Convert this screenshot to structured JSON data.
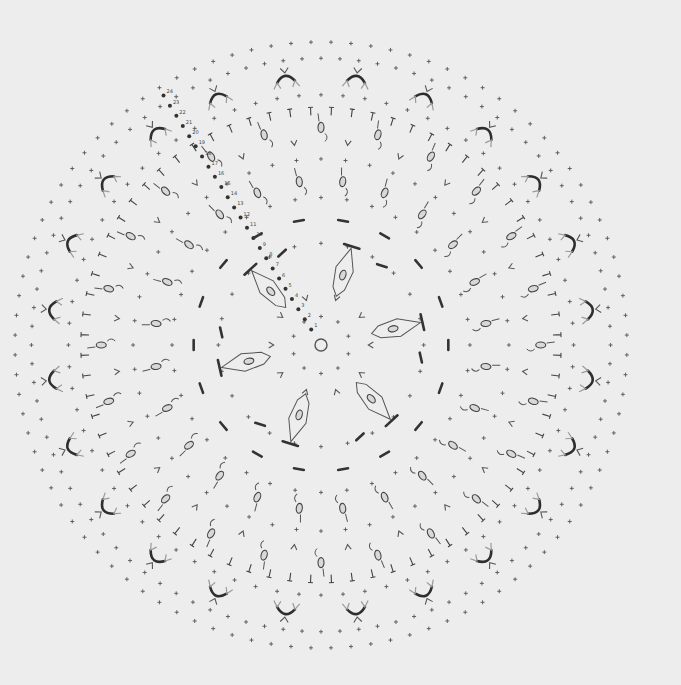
{
  "diagram": {
    "type": "crochet-doily-chart",
    "background": "#ededed",
    "ink": "#333333",
    "light_ink": "#9a9a9a",
    "center": {
      "x": 321,
      "y": 345
    },
    "outer_radius_x": 306,
    "outer_radius_y": 303,
    "center_ring": {
      "symbol": "magic-ring",
      "radius": 6
    },
    "inner_motif": {
      "petals": 6,
      "radius": 72,
      "symbol": "kite-cluster"
    },
    "round_labels": [
      "1",
      "2",
      "3",
      "4",
      "5",
      "6",
      "7",
      "8",
      "9",
      "10",
      "11",
      "12",
      "13",
      "14",
      "15",
      "16",
      "17",
      "18",
      "19",
      "20",
      "21",
      "22",
      "23",
      "24"
    ],
    "round_label_angle_deg": -122,
    "rings": [
      {
        "r": 28,
        "symbol": "sc-plus",
        "count": 10
      },
      {
        "r": 48,
        "symbol": "chain-v",
        "count": 10
      },
      {
        "r": 100,
        "symbol": "sc-plus",
        "count": 24
      },
      {
        "r": 124,
        "symbol": "bar-cluster",
        "count": 18
      },
      {
        "r": 145,
        "symbol": "sc-plus",
        "count": 36
      },
      {
        "r": 162,
        "symbol": "oval-picot-spoke",
        "count": 24
      },
      {
        "r": 183,
        "symbol": "sc-plus",
        "count": 48
      },
      {
        "r": 200,
        "symbol": "chain-v",
        "count": 24
      },
      {
        "r": 214,
        "symbol": "oval-picot-spoke",
        "count": 24
      },
      {
        "r": 230,
        "symbol": "dc-tee",
        "count": 72
      },
      {
        "r": 246,
        "symbol": "sc-plus",
        "count": 72
      },
      {
        "r": 263,
        "symbol": "scallop-arc",
        "count": 24
      },
      {
        "r": 282,
        "symbol": "sc-plus",
        "count": 96
      },
      {
        "r": 298,
        "symbol": "sc-plus",
        "count": 96
      }
    ],
    "legend": {
      "sc-plus": "single crochet (+)",
      "dc-tee": "double crochet (T)",
      "chain-v": "V-stitch",
      "scallop-arc": "chain arc with V-stitches",
      "oval-picot-spoke": "chain loop (oval) with hook picot",
      "bar-cluster": "bar (post stitch)",
      "magic-ring": "starting ring"
    }
  }
}
